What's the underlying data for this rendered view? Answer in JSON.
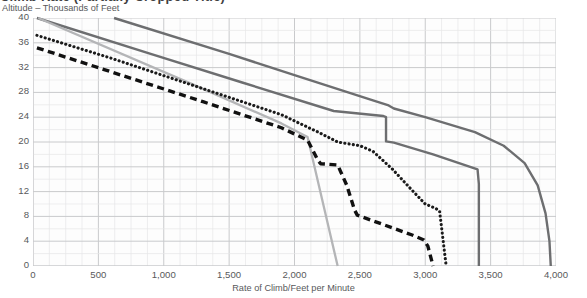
{
  "title": "Climb Rate (Partially Cropped Title)",
  "axes": {
    "y_title": "Altitude – Thousands of Feet",
    "x_title": "Rate of Climb/Feet per Minute",
    "y_ticks": [
      "0",
      "4",
      "8",
      "12",
      "16",
      "20",
      "24",
      "28",
      "32",
      "36",
      "40"
    ],
    "x_ticks": [
      "0",
      "500",
      "1,000",
      "1,500",
      "2,000",
      "2,500",
      "3,000",
      "3,500",
      "4,000"
    ]
  },
  "colors": {
    "series_dark": "#6d6e70",
    "series_light": "#b4b5b7",
    "series_dotted": "#1b1b1b",
    "series_dashed": "#111111",
    "grid_major": "#c9cacc",
    "grid_minor": "#e6e7e8",
    "text": "#58595b"
  },
  "chart_data": {
    "type": "line",
    "title": "Climb Rate (Partially Cropped Title)",
    "xlabel": "Rate of Climb/Feet per Minute",
    "ylabel": "Altitude – Thousands of Feet",
    "xlim": [
      0,
      4000
    ],
    "ylim": [
      0,
      40
    ],
    "xticks": [
      0,
      500,
      1000,
      1500,
      2000,
      2500,
      3000,
      3500,
      4000
    ],
    "yticks": [
      0,
      4,
      8,
      12,
      16,
      20,
      24,
      28,
      32,
      36,
      40
    ],
    "grid": true,
    "legend": "none",
    "series": [
      {
        "name": "Upper solid dark curve",
        "style": "solid",
        "color": "#6d6e70",
        "points": [
          [
            620,
            40
          ],
          [
            1500,
            34.2
          ],
          [
            2000,
            30.8
          ],
          [
            2600,
            26.7
          ],
          [
            2720,
            25.9
          ],
          [
            2760,
            25.4
          ],
          [
            3000,
            24.0
          ],
          [
            3380,
            21.6
          ],
          [
            3600,
            19.4
          ],
          [
            3760,
            16.6
          ],
          [
            3860,
            13.0
          ],
          [
            3920,
            8.5
          ],
          [
            3950,
            4.0
          ],
          [
            3960,
            0
          ]
        ]
      },
      {
        "name": "Lower solid dark curve",
        "style": "solid",
        "color": "#6d6e70",
        "points": [
          [
            30,
            40
          ],
          [
            900,
            34.2
          ],
          [
            1600,
            29.6
          ],
          [
            2300,
            25.0
          ],
          [
            2680,
            24.2
          ],
          [
            2700,
            24.0
          ],
          [
            2700,
            20.1
          ],
          [
            2760,
            19.9
          ],
          [
            3060,
            18.0
          ],
          [
            3400,
            15.6
          ],
          [
            3410,
            13.2
          ],
          [
            3410,
            0
          ]
        ]
      },
      {
        "name": "Light gray line",
        "style": "solid",
        "color": "#b4b5b7",
        "points": [
          [
            40,
            40
          ],
          [
            1200,
            29.5
          ],
          [
            1900,
            23.0
          ],
          [
            2100,
            20.8
          ],
          [
            2330,
            0
          ]
        ]
      },
      {
        "name": "Dotted line",
        "style": "dotted",
        "color": "#1b1b1b",
        "points": [
          [
            30,
            37.2
          ],
          [
            600,
            33.5
          ],
          [
            1200,
            29.3
          ],
          [
            1900,
            24.4
          ],
          [
            2200,
            21.4
          ],
          [
            2330,
            20.0
          ],
          [
            2500,
            19.4
          ],
          [
            2600,
            18.5
          ],
          [
            2750,
            15.6
          ],
          [
            2900,
            12.2
          ],
          [
            3000,
            10.0
          ],
          [
            3080,
            9.3
          ],
          [
            3110,
            8.8
          ],
          [
            3160,
            0
          ]
        ]
      },
      {
        "name": "Dashed line",
        "style": "dashed",
        "color": "#111111",
        "points": [
          [
            30,
            35.2
          ],
          [
            600,
            31.3
          ],
          [
            1300,
            26.5
          ],
          [
            1900,
            22.3
          ],
          [
            2100,
            20.3
          ],
          [
            2180,
            17.0
          ],
          [
            2200,
            16.5
          ],
          [
            2330,
            16.3
          ],
          [
            2400,
            13.0
          ],
          [
            2460,
            9.0
          ],
          [
            2480,
            8.2
          ],
          [
            2900,
            5.0
          ],
          [
            2990,
            4.2
          ],
          [
            3020,
            3.2
          ],
          [
            3060,
            0
          ]
        ]
      }
    ]
  }
}
